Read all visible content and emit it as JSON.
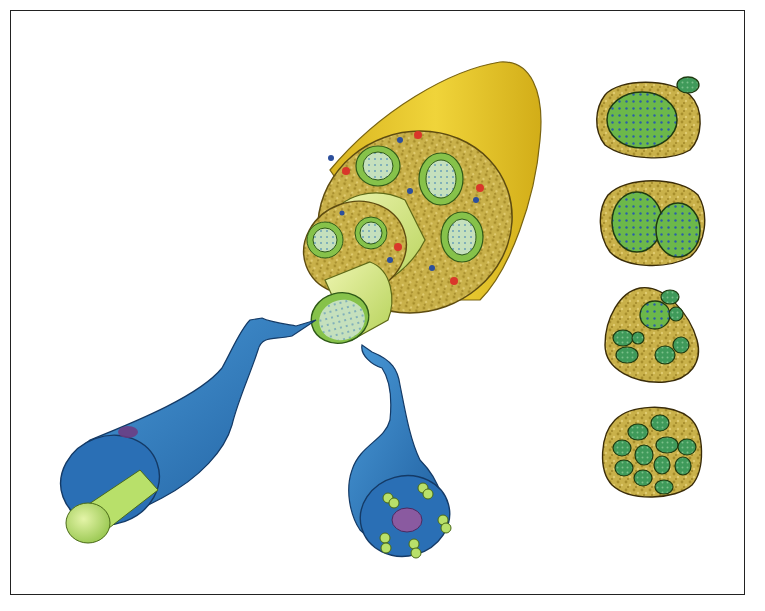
{
  "figure": {
    "type": "anatomical-illustration",
    "labels": [],
    "colors": {
      "epineurium_outer": "#e2c12a",
      "epineurium_tissue": "#c9b14a",
      "fascicle_ring": "#86c24a",
      "fascicle_core": "#b9d8b0",
      "perineurium_tube": "#d6e78a",
      "axon_blue": "#2f7fc2",
      "axon_core_green": "#b8e06a",
      "vessel_red": "#d9372a",
      "vessel_blue": "#2c4f9c",
      "nucleus_purple": "#8a5aa0",
      "frame_border": "#222222"
    },
    "cross_section_panels": [
      {
        "index": 1,
        "fascicle_count": 2,
        "pattern": "one large + one small"
      },
      {
        "index": 2,
        "fascicle_count": 2,
        "pattern": "two equal"
      },
      {
        "index": 3,
        "fascicle_count": 8,
        "pattern": "clustered groups"
      },
      {
        "index": 4,
        "fascicle_count": 12,
        "pattern": "many small"
      }
    ]
  }
}
